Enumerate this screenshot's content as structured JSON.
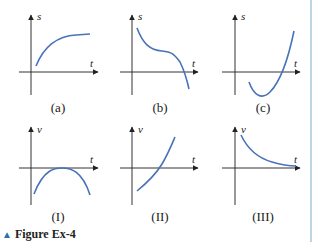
{
  "figure": {
    "caption_marker": "▲",
    "caption": "Figure Ex-4",
    "accent_color": "#2a6ea8",
    "curve_color": "#4a72b8",
    "rule_color": "#bcd6e6"
  },
  "position_graphs": [
    {
      "label": "(a)",
      "y_axis": "s",
      "x_axis": "t",
      "description": "increasing, concave down, levels off"
    },
    {
      "label": "(b)",
      "y_axis": "s",
      "x_axis": "t",
      "description": "decreasing, inflection plateau, then drops below zero"
    },
    {
      "label": "(c)",
      "y_axis": "s",
      "x_axis": "t",
      "description": "dips below zero to a minimum then rises steeply"
    }
  ],
  "velocity_graphs": [
    {
      "label": "(I)",
      "y_axis": "v",
      "x_axis": "t",
      "description": "negative parabola touching zero at its maximum"
    },
    {
      "label": "(II)",
      "y_axis": "v",
      "x_axis": "t",
      "description": "increasing from negative through zero, concave up"
    },
    {
      "label": "(III)",
      "y_axis": "v",
      "x_axis": "t",
      "description": "positive, decreasing toward zero"
    }
  ]
}
